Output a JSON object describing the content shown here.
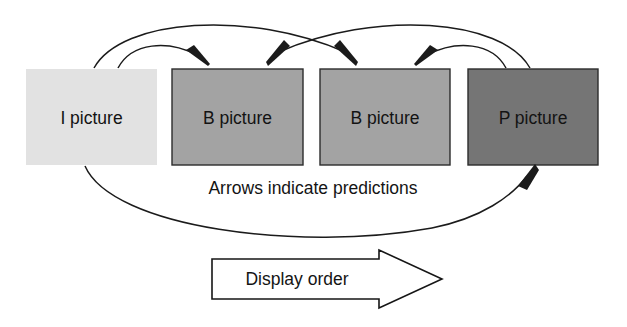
{
  "diagram": {
    "background_color": "#ffffff",
    "line_color": "#1b1b1b"
  },
  "boxes": [
    {
      "id": "i-picture",
      "label": "I picture",
      "fill": "#e2e2e2",
      "stroke": "none",
      "x": 26,
      "y": 69,
      "width": 131,
      "height": 96
    },
    {
      "id": "b-picture-1",
      "label": "B picture",
      "fill": "#a3a3a3",
      "stroke": "#2c2c2c",
      "x": 172,
      "y": 69,
      "width": 131,
      "height": 96
    },
    {
      "id": "b-picture-2",
      "label": "B picture",
      "fill": "#a3a3a3",
      "stroke": "#2c2c2c",
      "x": 320,
      "y": 69,
      "width": 130,
      "height": 96
    },
    {
      "id": "p-picture",
      "label": "P picture",
      "fill": "#757575",
      "stroke": "#2c2c2c",
      "x": 468,
      "y": 69,
      "width": 130,
      "height": 96
    }
  ],
  "captions": {
    "predictions_note": "Arrows indicate predictions",
    "display_order": "Display order"
  },
  "arrows": [
    {
      "id": "i-to-b1",
      "from": "I picture",
      "to": "B picture 1",
      "description": "short arc from I picture top to first B picture top-left"
    },
    {
      "id": "i-to-b2",
      "from": "I picture",
      "to": "B picture 2",
      "description": "long high arc from I picture top to second B picture top-left"
    },
    {
      "id": "p-to-b2",
      "from": "P picture",
      "to": "B picture 2",
      "description": "short arc from P picture top to second B picture top-right"
    },
    {
      "id": "p-to-b1",
      "from": "P picture",
      "to": "B picture 1",
      "description": "long high arc from P picture top to first B picture top-right"
    },
    {
      "id": "i-to-p",
      "from": "I picture",
      "to": "P picture",
      "description": "long low arc from I picture bottom to P picture bottom-right"
    }
  ]
}
